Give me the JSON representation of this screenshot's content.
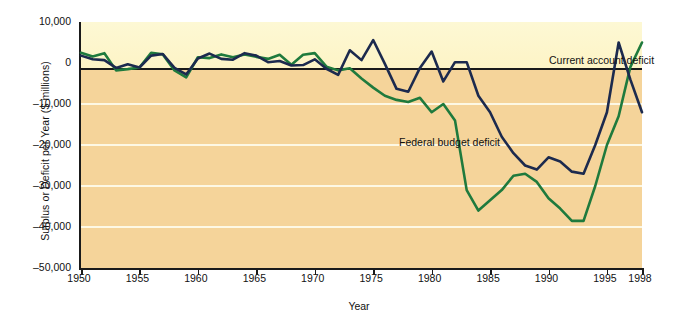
{
  "chart_data": {
    "type": "line",
    "title": "",
    "xlabel": "Year",
    "ylabel": "Surplus or Deficit per Year ($ millions)",
    "xlim": [
      1950,
      1998
    ],
    "ylim": [
      -50000,
      10000
    ],
    "ytick_values": [
      10000,
      0,
      -10000,
      -20000,
      -30000,
      -40000,
      -50000
    ],
    "ytick_labels": [
      "10,000",
      "0",
      "–10,000",
      "–20,000",
      "–30,000",
      "–40,000",
      "–50,000"
    ],
    "xtick_values": [
      1950,
      1955,
      1960,
      1965,
      1970,
      1975,
      1980,
      1985,
      1990,
      1995,
      1998
    ],
    "xtick_labels": [
      "1950",
      "1955",
      "1960",
      "1965",
      "1970",
      "1975",
      "1980",
      "1985",
      "1990",
      "1995",
      "1998"
    ],
    "grid": "horizontal-white-gridlines",
    "legend_position": "inline-annotations",
    "background_above_zero": "#fdf6cc",
    "background_below_zero": "#f5d49a",
    "series": [
      {
        "name": "Current account deficit",
        "color": "#1c2a4e",
        "x": [
          1950,
          1951,
          1952,
          1953,
          1954,
          1955,
          1956,
          1957,
          1958,
          1959,
          1960,
          1961,
          1962,
          1963,
          1964,
          1965,
          1966,
          1967,
          1968,
          1969,
          1970,
          1971,
          1972,
          1973,
          1974,
          1975,
          1976,
          1977,
          1978,
          1979,
          1980,
          1981,
          1982,
          1983,
          1984,
          1985,
          1986,
          1987,
          1988,
          1989,
          1990,
          1991,
          1992,
          1993,
          1994,
          1995,
          1996,
          1997,
          1998
        ],
        "values": [
          1800,
          900,
          700,
          -1200,
          -300,
          -1100,
          1800,
          2200,
          -1200,
          -2800,
          1100,
          2300,
          1000,
          800,
          2400,
          1800,
          200,
          500,
          -600,
          -500,
          900,
          -1400,
          -2900,
          3100,
          700,
          5600,
          -200,
          -6300,
          -7000,
          -1200,
          2800,
          -4500,
          200,
          200,
          -8000,
          -12000,
          -18000,
          -22000,
          -25000,
          -26000,
          -23000,
          -24000,
          -26500,
          -27000,
          -20000,
          -12000,
          5000,
          -4000,
          -12000
        ]
      },
      {
        "name": "Federal budget deficit",
        "color": "#1f7a3d",
        "x": [
          1950,
          1951,
          1952,
          1953,
          1954,
          1955,
          1956,
          1957,
          1958,
          1959,
          1960,
          1961,
          1962,
          1963,
          1964,
          1965,
          1966,
          1967,
          1968,
          1969,
          1970,
          1971,
          1972,
          1973,
          1974,
          1975,
          1976,
          1977,
          1978,
          1979,
          1980,
          1981,
          1982,
          1983,
          1984,
          1985,
          1986,
          1987,
          1988,
          1989,
          1990,
          1991,
          1992,
          1993,
          1994,
          1995,
          1996,
          1997,
          1998
        ],
        "values": [
          2500,
          1600,
          2400,
          -1800,
          -1500,
          -1100,
          2500,
          2100,
          -1800,
          -3500,
          1400,
          1200,
          2100,
          1400,
          2100,
          1500,
          1000,
          2000,
          -400,
          2000,
          2400,
          -900,
          -1800,
          -1300,
          -3800,
          -6000,
          -8000,
          -9000,
          -9500,
          -8500,
          -12000,
          -10000,
          -14000,
          -31000,
          -36000,
          -33500,
          -31000,
          -27500,
          -27000,
          -29000,
          -33000,
          -35500,
          -38500,
          -38500,
          -30000,
          -20000,
          -13000,
          -1000,
          5000
        ]
      }
    ]
  },
  "axis": {
    "ylabel": "Surplus or Deficit per Year ($ millions)",
    "xlabel": "Year"
  },
  "annotations": {
    "current_account": "Current account deficit",
    "federal_budget": "Federal budget deficit"
  }
}
